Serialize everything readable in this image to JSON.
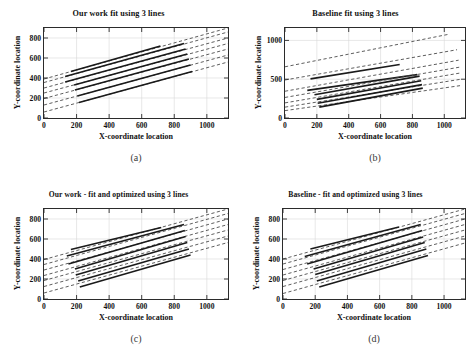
{
  "figure": {
    "background": "#ffffff",
    "axis_color": "#2b2b2b",
    "grid_color": "#d9d9d9",
    "solid_color": "#1a1a1a",
    "dashed_color": "#555555"
  },
  "panels": [
    {
      "id": "a",
      "caption": "(a)",
      "title": "Our work fit using  3 lines",
      "xlabel": "X-coordinate location",
      "ylabel": "Y-coordinate location",
      "xticks": [
        "0",
        "200",
        "400",
        "600",
        "800",
        "1000"
      ],
      "yticks": [
        "0",
        "200",
        "400",
        "600",
        "800"
      ]
    },
    {
      "id": "b",
      "caption": "(b)",
      "title": "Baseline fit using  3 lines",
      "xlabel": "X-coordinate location",
      "ylabel": "Y-coordinate location",
      "xticks": [
        "0",
        "200",
        "400",
        "600",
        "800",
        "1000"
      ],
      "yticks": [
        "0",
        "500",
        "1000"
      ]
    },
    {
      "id": "c",
      "caption": "(c)",
      "title": "Our work - fit and optimized using 3 lines",
      "xlabel": "X-coordinate location",
      "ylabel": "Y-coordinate location",
      "xticks": [
        "0",
        "200",
        "400",
        "600",
        "800",
        "1000"
      ],
      "yticks": [
        "0",
        "200",
        "400",
        "600",
        "800"
      ]
    },
    {
      "id": "d",
      "caption": "(d)",
      "title": "Baseline - fit and optimized using 3 lines",
      "xlabel": "X-coordinate location",
      "ylabel": "Y-coordinate location",
      "xticks": [
        "0",
        "200",
        "400",
        "600",
        "800",
        "1000"
      ],
      "yticks": [
        "0",
        "200",
        "400",
        "600",
        "800"
      ]
    }
  ],
  "chart_data": [
    {
      "type": "line",
      "panel": "a",
      "title": "Our work fit using  3 lines",
      "xlabel": "X-coordinate location",
      "ylabel": "Y-coordinate location",
      "xlim": [
        0,
        1130
      ],
      "ylim": [
        0,
        900
      ],
      "xticks": [
        0,
        200,
        400,
        600,
        800,
        1000
      ],
      "yticks": [
        0,
        200,
        400,
        600,
        800
      ],
      "grid": true,
      "legend": "none",
      "series": [
        {
          "name": "line-1",
          "style": "dashed",
          "x": [
            0,
            1130
          ],
          "y": [
            390,
            900
          ]
        },
        {
          "name": "line-1-fit",
          "style": "solid",
          "x": [
            165,
            715
          ],
          "y": [
            465,
            720
          ]
        },
        {
          "name": "line-2",
          "style": "dashed",
          "x": [
            0,
            1130
          ],
          "y": [
            355,
            860
          ]
        },
        {
          "name": "line-2-fit",
          "style": "solid",
          "x": [
            130,
            860
          ],
          "y": [
            415,
            745
          ]
        },
        {
          "name": "line-3",
          "style": "dashed",
          "x": [
            0,
            1130
          ],
          "y": [
            300,
            800
          ]
        },
        {
          "name": "line-3-fit",
          "style": "solid",
          "x": [
            130,
            870
          ],
          "y": [
            360,
            690
          ]
        },
        {
          "name": "line-4",
          "style": "dashed",
          "x": [
            0,
            1130
          ],
          "y": [
            250,
            745
          ]
        },
        {
          "name": "line-4-fit",
          "style": "solid",
          "x": [
            185,
            880
          ],
          "y": [
            330,
            640
          ]
        },
        {
          "name": "line-5",
          "style": "dashed",
          "x": [
            0,
            1130
          ],
          "y": [
            195,
            690
          ]
        },
        {
          "name": "line-5-fit",
          "style": "solid",
          "x": [
            190,
            890
          ],
          "y": [
            280,
            590
          ]
        },
        {
          "name": "line-6",
          "style": "dashed",
          "x": [
            0,
            1130
          ],
          "y": [
            130,
            630
          ]
        },
        {
          "name": "line-6-fit",
          "style": "solid",
          "x": [
            205,
            900
          ],
          "y": [
            220,
            530
          ]
        },
        {
          "name": "line-7",
          "style": "dashed",
          "x": [
            0,
            1130
          ],
          "y": [
            60,
            560
          ]
        },
        {
          "name": "line-7-fit",
          "style": "solid",
          "x": [
            215,
            910
          ],
          "y": [
            155,
            465
          ]
        }
      ]
    },
    {
      "type": "line",
      "panel": "b",
      "title": "Baseline fit using  3 lines",
      "xlabel": "X-coordinate location",
      "ylabel": "Y-coordinate location",
      "xlim": [
        0,
        1130
      ],
      "ylim": [
        0,
        1160
      ],
      "xticks": [
        0,
        200,
        400,
        600,
        800,
        1000
      ],
      "yticks": [
        0,
        500,
        1000
      ],
      "grid": true,
      "legend": "none",
      "series": [
        {
          "name": "line-1",
          "style": "dashed",
          "x": [
            0,
            1030
          ],
          "y": [
            660,
            1080
          ]
        },
        {
          "name": "line-2",
          "style": "dashed",
          "x": [
            0,
            1080
          ],
          "y": [
            490,
            880
          ]
        },
        {
          "name": "line-2-fit",
          "style": "solid",
          "x": [
            160,
            720
          ],
          "y": [
            505,
            690
          ]
        },
        {
          "name": "line-3",
          "style": "dashed",
          "x": [
            0,
            1090
          ],
          "y": [
            345,
            745
          ]
        },
        {
          "name": "line-3-fit",
          "style": "solid",
          "x": [
            140,
            830
          ],
          "y": [
            355,
            560
          ]
        },
        {
          "name": "line-4",
          "style": "dashed",
          "x": [
            0,
            1095
          ],
          "y": [
            265,
            655
          ]
        },
        {
          "name": "line-4-fit",
          "style": "solid",
          "x": [
            185,
            845
          ],
          "y": [
            300,
            540
          ]
        },
        {
          "name": "line-5",
          "style": "dashed",
          "x": [
            0,
            1100
          ],
          "y": [
            195,
            580
          ]
        },
        {
          "name": "line-5-fit",
          "style": "solid",
          "x": [
            200,
            855
          ],
          "y": [
            240,
            480
          ]
        },
        {
          "name": "line-6",
          "style": "dashed",
          "x": [
            0,
            1105
          ],
          "y": [
            140,
            500
          ]
        },
        {
          "name": "line-6-fit",
          "style": "solid",
          "x": [
            205,
            860
          ],
          "y": [
            190,
            430
          ]
        },
        {
          "name": "line-7",
          "style": "dashed",
          "x": [
            0,
            1110
          ],
          "y": [
            95,
            420
          ]
        },
        {
          "name": "line-7-fit",
          "style": "solid",
          "x": [
            215,
            865
          ],
          "y": [
            140,
            385
          ]
        }
      ]
    },
    {
      "type": "line",
      "panel": "c",
      "title": "Our work - fit and optimized using 3 lines",
      "xlabel": "X-coordinate location",
      "ylabel": "Y-coordinate location",
      "xlim": [
        0,
        1130
      ],
      "ylim": [
        0,
        900
      ],
      "xticks": [
        0,
        200,
        400,
        600,
        800,
        1000
      ],
      "yticks": [
        0,
        200,
        400,
        600,
        800
      ],
      "grid": true,
      "legend": "none",
      "series": [
        {
          "name": "line-1",
          "style": "dashed",
          "x": [
            0,
            1130
          ],
          "y": [
            395,
            900
          ]
        },
        {
          "name": "line-1-fit",
          "style": "solid",
          "x": [
            165,
            720
          ],
          "y": [
            495,
            715
          ]
        },
        {
          "name": "line-2",
          "style": "dashed",
          "x": [
            0,
            1130
          ],
          "y": [
            345,
            855
          ]
        },
        {
          "name": "line-2-fit",
          "style": "solid",
          "x": [
            140,
            860
          ],
          "y": [
            430,
            745
          ]
        },
        {
          "name": "line-3",
          "style": "dashed",
          "x": [
            0,
            1130
          ],
          "y": [
            290,
            800
          ]
        },
        {
          "name": "line-3-fit",
          "style": "solid",
          "x": [
            150,
            865
          ],
          "y": [
            350,
            685
          ]
        },
        {
          "name": "line-4",
          "style": "dashed",
          "x": [
            0,
            1130
          ],
          "y": [
            235,
            745
          ]
        },
        {
          "name": "line-4-fit",
          "style": "solid",
          "x": [
            190,
            870
          ],
          "y": [
            300,
            625
          ]
        },
        {
          "name": "line-5",
          "style": "dashed",
          "x": [
            0,
            1130
          ],
          "y": [
            185,
            690
          ]
        },
        {
          "name": "line-5-fit",
          "style": "solid",
          "x": [
            195,
            880
          ],
          "y": [
            240,
            565
          ]
        },
        {
          "name": "line-6",
          "style": "dashed",
          "x": [
            0,
            1130
          ],
          "y": [
            125,
            630
          ]
        },
        {
          "name": "line-6-fit",
          "style": "solid",
          "x": [
            210,
            890
          ],
          "y": [
            180,
            500
          ]
        },
        {
          "name": "line-7",
          "style": "dashed",
          "x": [
            0,
            1130
          ],
          "y": [
            60,
            565
          ]
        },
        {
          "name": "line-7-fit",
          "style": "solid",
          "x": [
            220,
            900
          ],
          "y": [
            120,
            440
          ]
        }
      ]
    },
    {
      "type": "line",
      "panel": "d",
      "title": "Baseline - fit and optimized using 3 lines",
      "xlabel": "X-coordinate location",
      "ylabel": "Y-coordinate location",
      "xlim": [
        0,
        1130
      ],
      "ylim": [
        0,
        900
      ],
      "xticks": [
        0,
        200,
        400,
        600,
        800,
        1000
      ],
      "yticks": [
        0,
        200,
        400,
        600,
        800
      ],
      "grid": true,
      "legend": "none",
      "series": [
        {
          "name": "line-1",
          "style": "dashed",
          "x": [
            0,
            1130
          ],
          "y": [
            400,
            900
          ]
        },
        {
          "name": "line-1-fit",
          "style": "solid",
          "x": [
            170,
            720
          ],
          "y": [
            500,
            720
          ]
        },
        {
          "name": "line-2",
          "style": "dashed",
          "x": [
            0,
            1130
          ],
          "y": [
            350,
            855
          ]
        },
        {
          "name": "line-2-fit",
          "style": "solid",
          "x": [
            135,
            855
          ],
          "y": [
            425,
            745
          ]
        },
        {
          "name": "line-3",
          "style": "dashed",
          "x": [
            0,
            1130
          ],
          "y": [
            295,
            800
          ]
        },
        {
          "name": "line-3-fit",
          "style": "solid",
          "x": [
            150,
            865
          ],
          "y": [
            350,
            685
          ]
        },
        {
          "name": "line-4",
          "style": "dashed",
          "x": [
            0,
            1130
          ],
          "y": [
            240,
            745
          ]
        },
        {
          "name": "line-4-fit",
          "style": "solid",
          "x": [
            190,
            870
          ],
          "y": [
            300,
            620
          ]
        },
        {
          "name": "line-5",
          "style": "dashed",
          "x": [
            0,
            1130
          ],
          "y": [
            185,
            690
          ]
        },
        {
          "name": "line-5-fit",
          "style": "solid",
          "x": [
            200,
            880
          ],
          "y": [
            245,
            565
          ]
        },
        {
          "name": "line-6",
          "style": "dashed",
          "x": [
            0,
            1130
          ],
          "y": [
            125,
            630
          ]
        },
        {
          "name": "line-6-fit",
          "style": "solid",
          "x": [
            210,
            890
          ],
          "y": [
            180,
            500
          ]
        },
        {
          "name": "line-7",
          "style": "dashed",
          "x": [
            0,
            1130
          ],
          "y": [
            55,
            560
          ]
        },
        {
          "name": "line-7-fit",
          "style": "solid",
          "x": [
            225,
            900
          ],
          "y": [
            120,
            435
          ]
        }
      ]
    }
  ]
}
